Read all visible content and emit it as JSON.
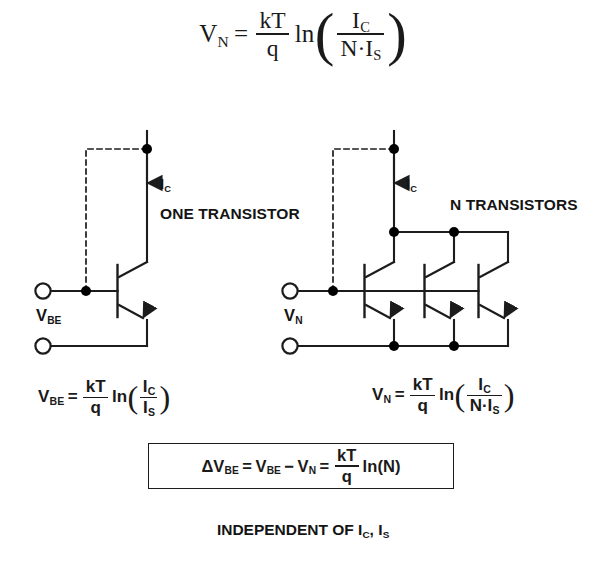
{
  "colors": {
    "background": "#ffffff",
    "ink": "#111111",
    "wire": "#1c1c1c",
    "node": "#000000"
  },
  "formula_top": {
    "lhs_var": "V",
    "lhs_sub": "N",
    "equals": "=",
    "frac_num": "kT",
    "frac_den": "q",
    "ln": "ln",
    "paren_open": "(",
    "paren_close": ")",
    "inner_num_var": "I",
    "inner_num_sub": "C",
    "inner_den": "N·I",
    "inner_den_sub": "S"
  },
  "left_circuit": {
    "current_label_var": "I",
    "current_label_sub": "C",
    "title": "ONE TRANSISTOR",
    "terminal_label_var": "V",
    "terminal_label_sub": "BE",
    "transistor_count": 1,
    "nodes": [
      "collector-top-node",
      "base-node"
    ],
    "terminals": [
      "top-terminal-circle",
      "bottom-terminal-circle"
    ],
    "feedback": "dashed-connection"
  },
  "right_circuit": {
    "current_label_var": "I",
    "current_label_sub": "C",
    "title": "N TRANSISTORS",
    "terminal_label_var": "V",
    "terminal_label_sub": "N",
    "transistor_count": 3,
    "nodes": [
      "collector-top-node",
      "base-node",
      "collector-rail-node-2",
      "collector-rail-node-3",
      "emitter-rail-node-1",
      "emitter-rail-node-2"
    ],
    "terminals": [
      "top-terminal-circle",
      "bottom-terminal-circle"
    ],
    "feedback": "dashed-connection"
  },
  "formula_left": {
    "lhs_var": "V",
    "lhs_sub": "BE",
    "equals": "=",
    "frac_num": "kT",
    "frac_den": "q",
    "ln": "ln",
    "paren_open": "(",
    "paren_close": ")",
    "inner_num_var": "I",
    "inner_num_sub": "C",
    "inner_den_var": "I",
    "inner_den_sub": "S"
  },
  "formula_right": {
    "lhs_var": "V",
    "lhs_sub": "N",
    "equals": "=",
    "frac_num": "kT",
    "frac_den": "q",
    "ln": "ln",
    "paren_open": "(",
    "paren_close": ")",
    "inner_num_var": "I",
    "inner_num_sub": "C",
    "inner_den": "N·I",
    "inner_den_sub": "S"
  },
  "formula_box": {
    "delta": "Δ",
    "lhs_var": "V",
    "lhs_sub": "BE",
    "equals1": "=",
    "t1_var": "V",
    "t1_sub": "BE",
    "minus": "−",
    "t2_var": "V",
    "t2_sub": "N",
    "equals2": "=",
    "frac_num": "kT",
    "frac_den": "q",
    "ln": "ln",
    "arg": "(N)"
  },
  "caption": {
    "text": "INDEPENDENT OF I",
    "sub1": "C",
    "comma": ", I",
    "sub2": "S"
  }
}
